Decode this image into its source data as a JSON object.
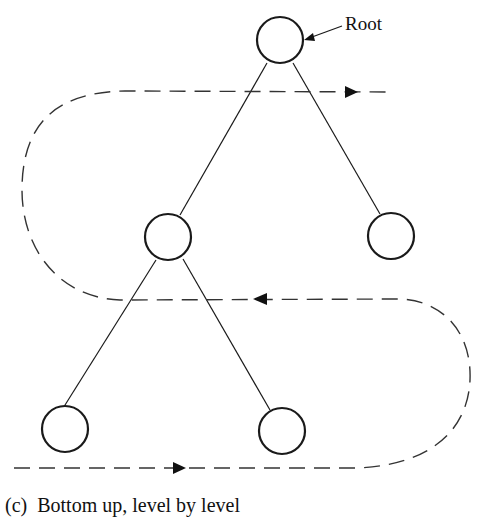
{
  "diagram": {
    "root_label": "Root",
    "caption": "(c)  Bottom up, level by level",
    "nodes": [
      {
        "id": "root",
        "level": 0
      },
      {
        "id": "left-child",
        "level": 1
      },
      {
        "id": "right-child",
        "level": 1
      },
      {
        "id": "left-left-grandchild",
        "level": 2
      },
      {
        "id": "left-right-grandchild",
        "level": 2
      }
    ],
    "traversal": {
      "order": "bottom up, level by level",
      "passes": [
        {
          "level": 2,
          "direction": "left-to-right"
        },
        {
          "level": 1,
          "direction": "right-to-left"
        },
        {
          "level": 0,
          "direction": "left-to-right"
        }
      ]
    }
  }
}
